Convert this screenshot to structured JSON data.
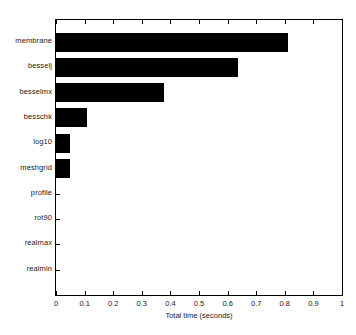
{
  "chart_data": {
    "type": "bar",
    "orientation": "horizontal",
    "title": "",
    "xlabel": "Total time (seconds)",
    "ylabel": "",
    "categories": [
      "membrane",
      "besselj",
      "besselmx",
      "besschk",
      "log10",
      "meshgrid",
      "profile",
      "rot90",
      "realmax",
      "realmin"
    ],
    "values": [
      0.81,
      0.635,
      0.378,
      0.107,
      0.048,
      0.048,
      0,
      0,
      0,
      0
    ],
    "xlim": [
      0,
      1
    ],
    "xticks": [
      0,
      0.1,
      0.2,
      0.3,
      0.4,
      0.5,
      0.6,
      0.7,
      0.8,
      0.9,
      1
    ],
    "xtick_labels": [
      "0",
      "0.1",
      "0.2",
      "0.3",
      "0.4",
      "0.5",
      "0.6",
      "0.7",
      "0.8",
      "0.9",
      "1"
    ],
    "grid": false,
    "legend": null,
    "bar_color": "#000000",
    "axes_color": "#000000",
    "background_color": "#ffffff",
    "text_color": "#1a1a1a"
  }
}
